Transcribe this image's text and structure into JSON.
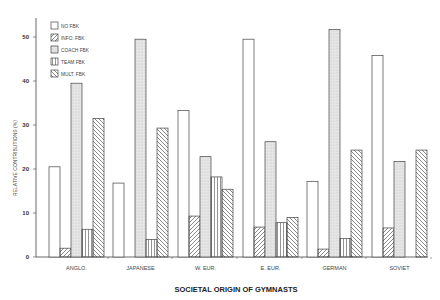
{
  "chart_data": {
    "type": "bar",
    "title": "",
    "xlabel": "SOCIETAL ORIGIN OF GYMNASTS",
    "ylabel": "RELATIVE CONTRIBUTIONS (%)",
    "ylim": [
      0,
      55
    ],
    "yticks": [
      0,
      10,
      20,
      30,
      40,
      50
    ],
    "grid": false,
    "legend_position": "top-left",
    "categories": [
      "ANGLO.",
      "JAPANESE",
      "W. EUR.",
      "E. EUR.",
      "GERMAN",
      "SOVIET"
    ],
    "series": [
      {
        "name": "NO FBK",
        "pattern": "empty",
        "values": [
          20.5,
          16.8,
          33.3,
          49.5,
          17.2,
          45.8
        ]
      },
      {
        "name": "INFO. FBK",
        "pattern": "diagonal-up",
        "values": [
          2.0,
          0,
          9.3,
          6.8,
          1.8,
          6.6
        ]
      },
      {
        "name": "COACH FBK",
        "pattern": "stipple",
        "values": [
          39.5,
          49.5,
          22.8,
          26.2,
          51.7,
          21.7
        ]
      },
      {
        "name": "TEAM FBK",
        "pattern": "vertical",
        "values": [
          6.3,
          4.0,
          18.2,
          7.8,
          4.2,
          0
        ]
      },
      {
        "name": "MULT. FBK",
        "pattern": "diagonal-down",
        "values": [
          31.5,
          29.3,
          15.4,
          9.0,
          24.3,
          24.3
        ]
      }
    ]
  },
  "colors": {
    "stroke": "#444444",
    "background": "#ffffff",
    "stipple": "#dcdcdc"
  }
}
